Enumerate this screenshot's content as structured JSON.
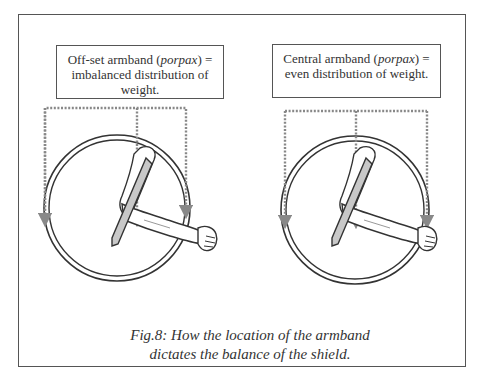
{
  "figure": {
    "left_panel": {
      "label_prefix": "Off-set armband (",
      "label_italic": "porpax",
      "label_suffix": ") = imbalanced distribution of weight.",
      "armband_position": "off-set"
    },
    "right_panel": {
      "label_prefix": "Central armband (",
      "label_italic": "porpax",
      "label_suffix": ") = even distribution of weight.",
      "armband_position": "central"
    },
    "caption_line1": "Fig.8: How the location of the armband",
    "caption_line2": "dictates the balance of the shield."
  },
  "colors": {
    "outline": "#333333",
    "dotted_arrow": "#888888",
    "frame": "#555555",
    "sword_fill": "#c8c8c8"
  }
}
